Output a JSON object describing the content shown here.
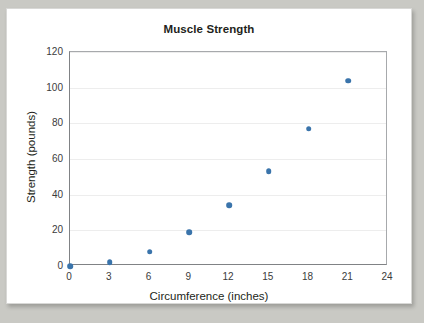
{
  "chart_data": {
    "type": "scatter",
    "title": "Muscle Strength",
    "xlabel": "Circumference (inches)",
    "ylabel": "Strength (pounds)",
    "xlim": [
      0,
      24
    ],
    "ylim": [
      0,
      120
    ],
    "x_ticks": [
      0,
      3,
      6,
      9,
      12,
      15,
      18,
      21,
      24
    ],
    "y_ticks": [
      0,
      20,
      40,
      60,
      80,
      100,
      120
    ],
    "grid": "horizontal",
    "legend": null,
    "marker_color": "#3a74ab",
    "x": [
      0,
      3,
      6,
      9,
      12,
      15,
      18,
      21
    ],
    "y": [
      0,
      2,
      8,
      19,
      34,
      53,
      77,
      104
    ],
    "points": [
      {
        "x": 0,
        "y": 0
      },
      {
        "x": 3,
        "y": 2
      },
      {
        "x": 6,
        "y": 8
      },
      {
        "x": 9,
        "y": 19
      },
      {
        "x": 12,
        "y": 34
      },
      {
        "x": 15,
        "y": 53
      },
      {
        "x": 18,
        "y": 77
      },
      {
        "x": 21,
        "y": 104
      }
    ]
  },
  "colors": {
    "marker": "#3a74ab",
    "axis": "#808285",
    "gridline": "#ededed",
    "text": "#231f20",
    "page_background": "#c9c9c4",
    "card_background": "#ffffff"
  }
}
